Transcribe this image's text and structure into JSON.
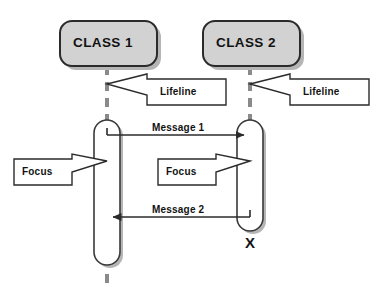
{
  "diagram": {
    "type": "uml-sequence-diagram",
    "background_color": "#ffffff",
    "stroke_color": "#2b2b2b",
    "lifeline_color": "#808080",
    "class_box_fill": "#d2d2d2",
    "activation_fill": "#ffffff",
    "shadow_color": "#b5b5b5"
  },
  "participants": [
    {
      "id": "class-1",
      "label": "CLASS 1",
      "box": {
        "x": 60,
        "y": 21,
        "width": 97,
        "height": 45,
        "radius": 12
      },
      "lifeline_x": 107,
      "lifeline_top": 66,
      "lifeline_bottom": 286,
      "activation": {
        "x": 94,
        "y": 120,
        "width": 26,
        "height": 145
      }
    },
    {
      "id": "class-2",
      "label": "CLASS 2",
      "box": {
        "x": 203,
        "y": 21,
        "width": 97,
        "height": 45,
        "radius": 12
      },
      "lifeline_x": 250,
      "lifeline_top": 66,
      "lifeline_bottom": 232,
      "activation": {
        "x": 237,
        "y": 120,
        "width": 26,
        "height": 111
      }
    }
  ],
  "messages": [
    {
      "id": "message-1",
      "label": "Message 1",
      "from": "class-1",
      "to": "class-2",
      "direction": "right",
      "y": 135,
      "label_x": 152,
      "label_y": 124
    },
    {
      "id": "message-2",
      "label": "Message 2",
      "from": "class-2",
      "to": "class-1",
      "direction": "left",
      "y": 217,
      "label_x": 152,
      "label_y": 206
    }
  ],
  "callouts": [
    {
      "id": "lifeline-callout-1",
      "label": "Lifeline",
      "points_to": "class-1-lifeline",
      "tip": {
        "x": 107,
        "y": 85
      },
      "box": {
        "x": 147,
        "y": 79,
        "width": 79,
        "height": 26
      },
      "text_x": 160,
      "text_y": 88
    },
    {
      "id": "lifeline-callout-2",
      "label": "Lifeline",
      "points_to": "class-2-lifeline",
      "tip": {
        "x": 250,
        "y": 85
      },
      "box": {
        "x": 290,
        "y": 79,
        "width": 79,
        "height": 26
      },
      "text_x": 303,
      "text_y": 88
    },
    {
      "id": "focus-callout-1",
      "label": "Focus",
      "points_to": "class-1-activation",
      "tip": {
        "x": 107,
        "y": 161
      },
      "box": {
        "x": 14,
        "y": 159,
        "width": 58,
        "height": 26
      },
      "text_x": 22,
      "text_y": 167
    },
    {
      "id": "focus-callout-2",
      "label": "Focus",
      "points_to": "class-2-activation",
      "tip": {
        "x": 250,
        "y": 161
      },
      "box": {
        "x": 158,
        "y": 159,
        "width": 58,
        "height": 26
      },
      "text_x": 166,
      "text_y": 167
    }
  ],
  "destruction": {
    "id": "destruction-marker",
    "label": "X",
    "x": 250,
    "y": 242
  }
}
